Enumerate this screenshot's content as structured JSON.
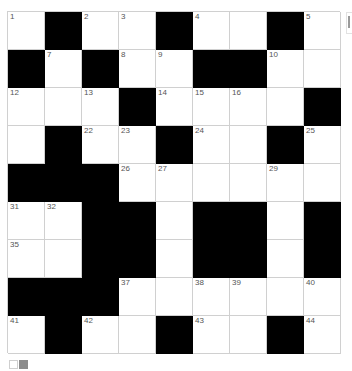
{
  "puzzle": {
    "rows": 9,
    "cols": 9,
    "colors": {
      "black": "#000000",
      "white": "#ffffff",
      "gridline": "#d0d0d0",
      "number": "#555555"
    },
    "grid": [
      [
        "1",
        "#",
        "2",
        "3",
        "#",
        "4",
        "",
        "#",
        "5"
      ],
      [
        "#",
        "7",
        "#",
        "8",
        "9",
        "#",
        "#",
        "10",
        ""
      ],
      [
        "12",
        "",
        "13",
        "#",
        "14",
        "15",
        "16",
        "",
        "#"
      ],
      [
        "",
        "#",
        "22",
        "23",
        "#",
        "24",
        "",
        "#",
        "25"
      ],
      [
        "#",
        "#",
        "#",
        "26",
        "27",
        "",
        "",
        "29",
        ""
      ],
      [
        "31",
        "32",
        "#",
        "#",
        "",
        "#",
        "#",
        "",
        "#"
      ],
      [
        "35",
        "",
        "#",
        "#",
        "",
        "#",
        "#",
        "",
        "#"
      ],
      [
        "#",
        "#",
        "#",
        "37",
        "",
        "38",
        "39",
        "",
        "40"
      ],
      [
        "41",
        "#",
        "42",
        "",
        "#",
        "43",
        "",
        "#",
        "44"
      ]
    ]
  },
  "controls": {
    "color_toggle": {
      "icon": "light-dark-toggle-icon",
      "colors": [
        "#ffffff",
        "#8c8c8c"
      ]
    },
    "side_tab": {
      "icon": "side-panel-tab-icon"
    }
  }
}
